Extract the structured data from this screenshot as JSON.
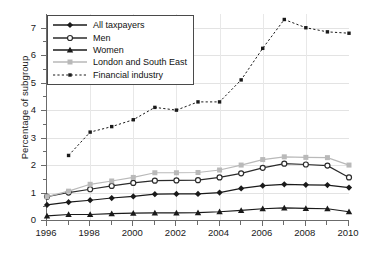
{
  "chart_data": {
    "type": "line",
    "title": "",
    "xlabel": "",
    "ylabel": "Percentage of subgroup",
    "xlim": [
      1996,
      2010
    ],
    "ylim": [
      0,
      7.5
    ],
    "yticks": [
      0,
      1,
      2,
      3,
      4,
      5,
      6,
      7
    ],
    "xticks": [
      1996,
      1998,
      2000,
      2002,
      2004,
      2006,
      2008,
      2010
    ],
    "xticks_minor": [
      1997,
      1999,
      2001,
      2003,
      2005,
      2007,
      2009
    ],
    "x": [
      1996,
      1997,
      1998,
      1999,
      2000,
      2001,
      2002,
      2003,
      2004,
      2005,
      2006,
      2007,
      2008,
      2009,
      2010
    ],
    "grid": true,
    "legend_position": "upper left",
    "series": [
      {
        "name": "All taxpayers",
        "marker": "filled-diamond",
        "linestyle": "solid",
        "color": "#1a1a1a",
        "values": [
          0.55,
          0.65,
          0.72,
          0.8,
          0.86,
          0.94,
          0.95,
          0.95,
          1.0,
          1.15,
          1.25,
          1.3,
          1.28,
          1.27,
          1.18
        ]
      },
      {
        "name": "Men",
        "marker": "open-circle",
        "linestyle": "solid",
        "color": "#2b2b2b",
        "values": [
          0.85,
          1.0,
          1.12,
          1.24,
          1.35,
          1.43,
          1.44,
          1.45,
          1.55,
          1.7,
          1.9,
          2.05,
          2.02,
          1.98,
          1.55
        ]
      },
      {
        "name": "Women",
        "marker": "filled-triangle",
        "linestyle": "solid",
        "color": "#1a1a1a",
        "values": [
          0.15,
          0.2,
          0.2,
          0.23,
          0.25,
          0.26,
          0.26,
          0.27,
          0.3,
          0.35,
          0.41,
          0.44,
          0.42,
          0.41,
          0.3
        ]
      },
      {
        "name": "London and South East",
        "marker": "filled-square",
        "linestyle": "solid",
        "color": "#b9b9b9",
        "values": [
          0.85,
          1.05,
          1.3,
          1.42,
          1.55,
          1.72,
          1.72,
          1.73,
          1.82,
          2.0,
          2.2,
          2.3,
          2.28,
          2.27,
          2.0
        ]
      },
      {
        "name": "Financial industry",
        "marker": "filled-square-small",
        "linestyle": "dashed",
        "color": "#1a1a1a",
        "values": [
          null,
          2.35,
          3.2,
          3.4,
          3.65,
          4.1,
          4.0,
          4.3,
          4.3,
          5.1,
          6.25,
          7.3,
          7.0,
          6.85,
          6.8
        ]
      }
    ]
  },
  "legend": {
    "items": [
      {
        "label": "All taxpayers"
      },
      {
        "label": "Men"
      },
      {
        "label": "Women"
      },
      {
        "label": "London and South East"
      },
      {
        "label": "Financial industry"
      }
    ]
  },
  "axis": {
    "ylabel": "Percentage of subgroup",
    "ytick_labels": [
      "0",
      "1",
      "2",
      "3",
      "4",
      "5",
      "6",
      "7"
    ],
    "xtick_labels": [
      "1996",
      "1998",
      "2000",
      "2002",
      "2004",
      "2006",
      "2008",
      "2010"
    ]
  }
}
